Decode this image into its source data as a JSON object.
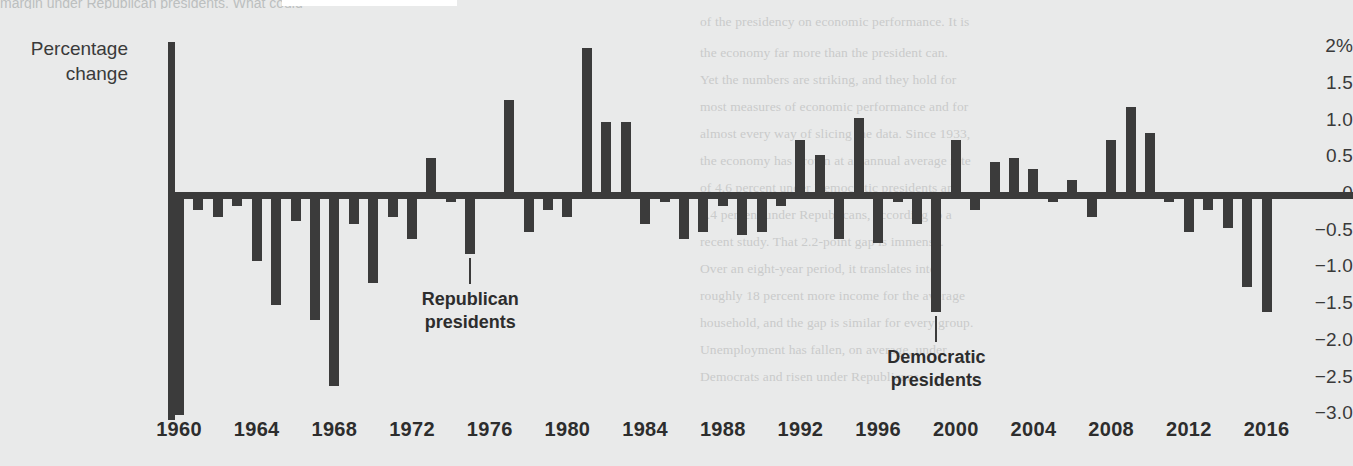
{
  "page": {
    "top_cutoff_text": "margin under Republican presidents. What could",
    "background_color": "#e9eaea",
    "ink_color": "#3b3b3b",
    "bleed_lines": [
      {
        "text": "of the presidency on economic performance. It is",
        "x": 700,
        "y": 14
      },
      {
        "text": "the economy far more than the president can.",
        "x": 700,
        "y": 45
      },
      {
        "text": "Yet the numbers are striking, and they hold for",
        "x": 700,
        "y": 72
      },
      {
        "text": "most measures of economic performance and for",
        "x": 700,
        "y": 99
      },
      {
        "text": "almost every way of slicing the data. Since 1933,",
        "x": 700,
        "y": 126
      },
      {
        "text": "the economy has grown at an annual average rate",
        "x": 700,
        "y": 153
      },
      {
        "text": "of 4.6 percent under Democratic presidents and",
        "x": 700,
        "y": 180
      },
      {
        "text": "2.4 percent under Republicans, according to a",
        "x": 700,
        "y": 207
      },
      {
        "text": "recent study. That 2.2-point gap is immense.",
        "x": 700,
        "y": 234
      },
      {
        "text": "Over an eight-year period, it translates into",
        "x": 700,
        "y": 261
      },
      {
        "text": "roughly 18 percent more income for the average",
        "x": 700,
        "y": 288
      },
      {
        "text": "household, and the gap is similar for every group.",
        "x": 700,
        "y": 315
      },
      {
        "text": "Unemployment has fallen, on average, under",
        "x": 700,
        "y": 342
      },
      {
        "text": "Democrats and risen under Republicans.",
        "x": 700,
        "y": 369
      }
    ]
  },
  "chart_data": {
    "type": "bar",
    "title": "",
    "xlabel": "",
    "ylabel": "Percentage change",
    "ylabel_line1": "Percentage",
    "ylabel_line2": "change",
    "ylim": [
      -3.0,
      2.0
    ],
    "ytick_labels": [
      "2%",
      "1.5",
      "1.0",
      "0.5",
      "0",
      "−0.5",
      "−1.0",
      "−1.5",
      "−2.0",
      "−2.5",
      "−3.0"
    ],
    "ytick_values": [
      2.0,
      1.5,
      1.0,
      0.5,
      0,
      -0.5,
      -1.0,
      -1.5,
      -2.0,
      -2.5,
      -3.0
    ],
    "xtick_labels": [
      "1960",
      "1964",
      "1968",
      "1972",
      "1976",
      "1980",
      "1984",
      "1988",
      "1992",
      "1996",
      "2000",
      "2004",
      "2008",
      "2012",
      "2016"
    ],
    "xtick_values": [
      1960,
      1964,
      1968,
      1972,
      1976,
      1980,
      1984,
      1988,
      1992,
      1996,
      2000,
      2004,
      2008,
      2012,
      2016
    ],
    "grid": false,
    "legend": "none",
    "bar_color": "#3b3b3b",
    "x": [
      1960,
      1961,
      1962,
      1963,
      1964,
      1965,
      1966,
      1967,
      1968,
      1969,
      1970,
      1971,
      1972,
      1973,
      1974,
      1975,
      1976,
      1977,
      1978,
      1979,
      1980,
      1981,
      1982,
      1983,
      1984,
      1985,
      1986,
      1987,
      1988,
      1989,
      1990,
      1991,
      1992,
      1993,
      1994,
      1995,
      1996,
      1997,
      1998,
      1999,
      2000,
      2001,
      2002,
      2003,
      2004,
      2005,
      2006,
      2007,
      2008,
      2009,
      2010,
      2011,
      2012,
      2013,
      2014,
      2015,
      2016
    ],
    "values": [
      -3.0,
      -0.2,
      -0.3,
      -0.15,
      -0.9,
      -1.5,
      -0.35,
      -1.7,
      -2.6,
      -0.4,
      -1.2,
      -0.3,
      -0.6,
      0.5,
      -0.1,
      -0.8,
      -0.05,
      1.3,
      -0.5,
      -0.2,
      -0.3,
      2.0,
      1.0,
      1.0,
      -0.4,
      -0.1,
      -0.6,
      -0.5,
      -0.15,
      -0.55,
      -0.5,
      -0.15,
      0.75,
      0.55,
      -0.6,
      1.05,
      -0.65,
      -0.1,
      -0.4,
      -1.6,
      0.75,
      -0.2,
      0.45,
      0.5,
      0.35,
      -0.1,
      0.2,
      -0.3,
      0.75,
      1.2,
      0.85,
      -0.1,
      -0.5,
      -0.2,
      -0.45,
      -1.25,
      -1.6
    ],
    "annotations": [
      {
        "label_line1": "Republican",
        "label_line2": "presidents",
        "points_to_year": 1975,
        "points_to_value": -0.8
      },
      {
        "label_line1": "Democratic",
        "label_line2": "presidents",
        "points_to_year": 1999,
        "points_to_value": -1.6
      }
    ]
  }
}
